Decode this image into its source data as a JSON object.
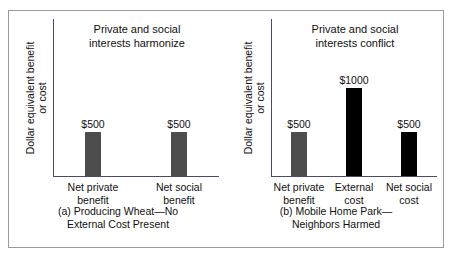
{
  "figure": {
    "background": "#ffffff",
    "frame_color": "#9a9a9a",
    "axis_color": "#4a4a6a",
    "gray_bar_color": "#4d4d4d",
    "black_bar_color": "#000000"
  },
  "chart_data": [
    {
      "type": "bar",
      "panel": "a",
      "title": "Private and social interests harmonize",
      "title_line1": "Private and social",
      "title_line2": "interests harmonize",
      "caption": "(a) Producing Wheat—No External Cost Present",
      "caption_line1": "(a) Producing Wheat—No",
      "caption_line2": "External Cost Present",
      "ylabel": "Dollar equivalent benefit or cost",
      "ylabel_line1": "Dollar equivalent benefit",
      "ylabel_line2": "or cost",
      "xlabel": "",
      "ylim": [
        0,
        1000
      ],
      "grid": false,
      "legend": "none",
      "categories": [
        "Net private benefit",
        "Net social benefit"
      ],
      "category_lines": [
        [
          "Net private",
          "benefit"
        ],
        [
          "Net social",
          "benefit"
        ]
      ],
      "values": [
        500,
        500
      ],
      "value_labels": [
        "$500",
        "$500"
      ],
      "bar_colors": [
        "#4d4d4d",
        "#4d4d4d"
      ]
    },
    {
      "type": "bar",
      "panel": "b",
      "title": "Private and social interests conflict",
      "title_line1": "Private and social",
      "title_line2": "interests conflict",
      "caption": "(b) Mobile Home Park—Neighbors Harmed",
      "caption_line1": "(b) Mobile Home Park—",
      "caption_line2": "Neighbors Harmed",
      "ylabel": "Dollar equivalent benefit or cost",
      "ylabel_line1": "Dollar equivalent benefit",
      "ylabel_line2": "or cost",
      "xlabel": "",
      "ylim": [
        0,
        1000
      ],
      "grid": false,
      "legend": "none",
      "categories": [
        "Net private benefit",
        "External cost",
        "Net social cost"
      ],
      "category_lines": [
        [
          "Net private",
          "benefit"
        ],
        [
          "External",
          "cost"
        ],
        [
          "Net social",
          "cost"
        ]
      ],
      "values": [
        500,
        1000,
        500
      ],
      "value_labels": [
        "$500",
        "$1000",
        "$500"
      ],
      "bar_colors": [
        "#4d4d4d",
        "#000000",
        "#000000"
      ]
    }
  ]
}
